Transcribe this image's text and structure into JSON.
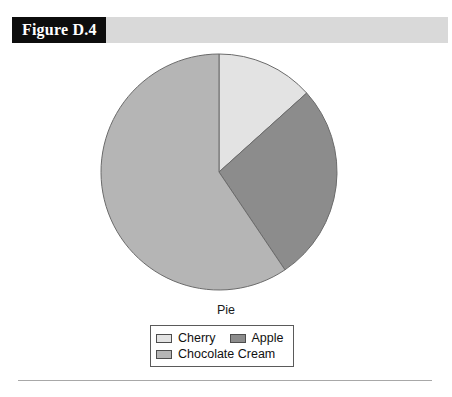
{
  "figure": {
    "tab_label": "Figure D.4"
  },
  "chart_data": {
    "type": "pie",
    "title": "Pie",
    "legend_position": "bottom",
    "categories": [
      "Cherry",
      "Apple",
      "Chocolate Cream"
    ],
    "values": [
      13.3,
      27.2,
      59.5
    ],
    "units": "percent",
    "start_angle_deg": 0,
    "direction": "clockwise",
    "slices": [
      {
        "label": "Cherry",
        "value": 13.3,
        "start_deg": 0,
        "end_deg": 48,
        "color": "#e3e3e3"
      },
      {
        "label": "Apple",
        "value": 27.2,
        "start_deg": 48,
        "end_deg": 146,
        "color": "#8c8c8c"
      },
      {
        "label": "Chocolate Cream",
        "value": 59.5,
        "start_deg": 146,
        "end_deg": 360,
        "color": "#b5b5b5"
      }
    ]
  },
  "legend": {
    "title": "Pie",
    "items": [
      {
        "label": "Cherry",
        "color": "#e3e3e3"
      },
      {
        "label": "Apple",
        "color": "#8c8c8c"
      },
      {
        "label": "Chocolate Cream",
        "color": "#b5b5b5"
      }
    ]
  },
  "colors": {
    "banner": "#d9d9d9",
    "tab_background": "#0d0d0d",
    "tab_text": "#ffffff",
    "slice_outline": "#6b6b6b",
    "rule": "#a8a8a8"
  }
}
